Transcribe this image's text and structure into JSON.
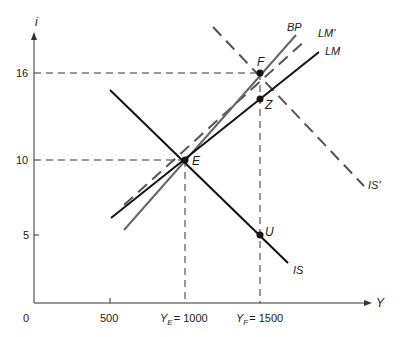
{
  "diagram": {
    "type": "IS-LM-BP diagram",
    "axes": {
      "y_label": "i",
      "x_label": "Y",
      "origin_label": "0",
      "y_ticks": [
        {
          "value": 16,
          "label": "16"
        },
        {
          "value": 10,
          "label": "10"
        },
        {
          "value": 5,
          "label": "5"
        }
      ],
      "x_ticks": [
        {
          "value": 500,
          "label": "500"
        },
        {
          "value": 1000,
          "label": "Y_E = 1000",
          "main": "Y",
          "sub": "E",
          "rest": "= 1000"
        },
        {
          "value": 1500,
          "label": "Y_F = 1500",
          "main": "Y",
          "sub": "F",
          "rest": "= 1500"
        }
      ]
    },
    "curves": [
      {
        "name": "IS",
        "label": "IS",
        "style": "solid",
        "color": "#111111"
      },
      {
        "name": "LM",
        "label": "LM",
        "style": "solid",
        "color": "#111111"
      },
      {
        "name": "BP",
        "label": "BP",
        "style": "solid",
        "color": "#666666"
      },
      {
        "name": "LM_prime",
        "label": "LM'",
        "style": "dashed",
        "color": "#555555"
      },
      {
        "name": "IS_prime",
        "label": "IS'",
        "style": "dashed",
        "color": "#555555"
      }
    ],
    "points": [
      {
        "name": "E",
        "label": "E",
        "Y": 1000,
        "i": 10
      },
      {
        "name": "F",
        "label": "F",
        "Y": 1500,
        "i": 16
      },
      {
        "name": "Z",
        "label": "Z",
        "Y": 1500,
        "i": 14.2
      },
      {
        "name": "U",
        "label": "U",
        "Y": 1500,
        "i": 5
      }
    ],
    "guide_lines": [
      {
        "from": "i=16 axis",
        "to": "F",
        "style": "dashed"
      },
      {
        "from": "i=10 axis",
        "to": "E",
        "style": "dashed"
      },
      {
        "from": "Y=1000 axis",
        "to": "E",
        "style": "dashed"
      },
      {
        "from": "Y=1500 axis",
        "to": "F",
        "style": "dashed"
      }
    ]
  }
}
